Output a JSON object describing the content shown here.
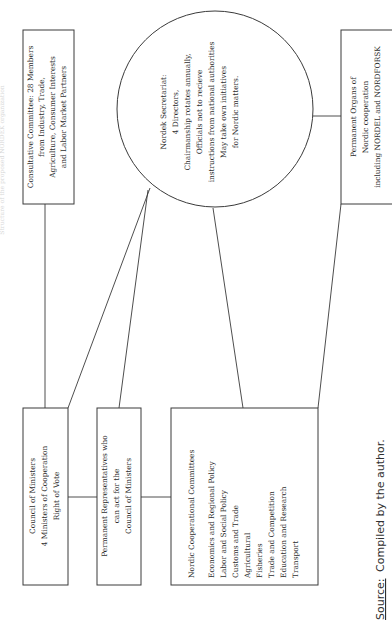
{
  "diagram": {
    "title": "Structure of the proposed NORDEK organization",
    "nodes": {
      "consultative_committee": {
        "lines": [
          "Consultative Committee: 28 Members",
          "from Industry, Trade,",
          "Agriculture, Consumer Interests",
          "and Labor Market Partners"
        ]
      },
      "nordek_secretariat": {
        "lines": [
          "Nordek Secretariat:",
          "4 Directors,",
          "Chairmanship rotates annually,",
          "Officials not to recieve",
          "instructions from national authorities",
          "May take own initiatives",
          "for Nordic matters."
        ]
      },
      "permanent_organs": {
        "lines": [
          "Permanent Organs of",
          "Nordic cooperation",
          "including NORDEL and NORDFORSK"
        ]
      },
      "council_of_ministers": {
        "lines": [
          "Council of Ministers",
          "4 Ministers of Cooperation",
          "Right of Vote"
        ]
      },
      "permanent_representatives": {
        "lines": [
          "Permanent Representatives who",
          "can act for the",
          "Council of Ministers"
        ]
      },
      "cooperational_committees": {
        "heading": "Nordic Cooperational Committees",
        "items": [
          "Economics and Regional Policy",
          "Labor and Social Policy",
          "Customs and Trade",
          "Agricultural",
          "Fisheries",
          "Trade and Competition",
          "Education and Research",
          "Transport"
        ]
      }
    },
    "edges": [
      [
        "council_of_ministers",
        "consultative_committee"
      ],
      [
        "council_of_ministers",
        "permanent_representatives"
      ],
      [
        "permanent_representatives",
        "cooperational_committees"
      ],
      [
        "council_of_ministers",
        "nordek_secretariat"
      ],
      [
        "permanent_representatives",
        "nordek_secretariat"
      ],
      [
        "cooperational_committees",
        "nordek_secretariat"
      ],
      [
        "cooperational_committees",
        "permanent_organs"
      ],
      [
        "nordek_secretariat",
        "permanent_organs"
      ]
    ],
    "source": {
      "label": "Source:",
      "text": "Compiled by the author."
    }
  }
}
